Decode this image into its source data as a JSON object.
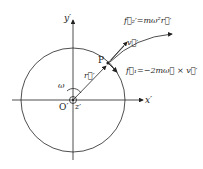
{
  "labels": {
    "y_axis": "y′",
    "x_axis": "x′",
    "origin": "O′",
    "z_axis": "z′",
    "omega": "ω",
    "point": "P",
    "r_vec": "r⃗′",
    "v_vec": "v⃗′",
    "f2": "f⃗₂′=mω²r⃗′",
    "f1": "f⃗₁=−2mω⃗ × v⃗′"
  },
  "colors": {
    "stroke": "#222222",
    "background": "#ffffff"
  }
}
